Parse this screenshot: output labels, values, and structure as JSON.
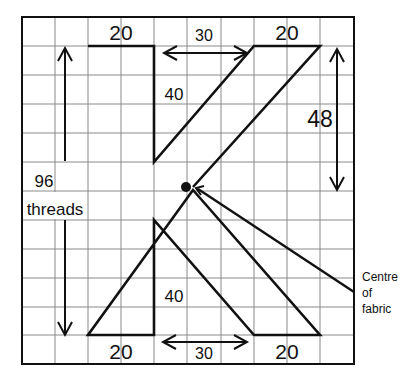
{
  "diagram": {
    "grid": {
      "columns": 10,
      "rows": 12
    },
    "labels": {
      "top_left_width": "20",
      "top_gap": "30",
      "top_right_width": "20",
      "upper_inner_height": "40",
      "right_height": "48",
      "total_height_value": "96",
      "total_height_unit": "threads",
      "lower_inner_height": "40",
      "bottom_left_width": "20",
      "bottom_gap": "30",
      "bottom_right_width": "20",
      "centre_line1": "Centre",
      "centre_line2": "of",
      "centre_line3": "fabric"
    },
    "colors": {
      "line": "#111111",
      "grid": "#8a8a8a",
      "background": "#ffffff"
    }
  }
}
